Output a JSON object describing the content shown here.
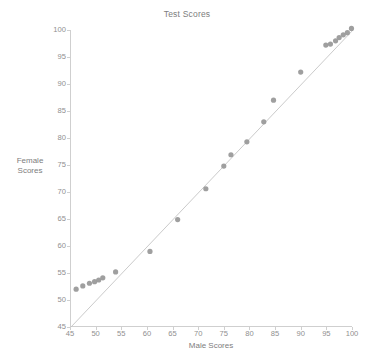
{
  "chart_data": {
    "type": "scatter",
    "title": "Test Scores",
    "xlabel": "Male Scores",
    "ylabel_line1": "Female",
    "ylabel_line2": "Scores",
    "xlim": [
      45,
      100
    ],
    "ylim": [
      45,
      100
    ],
    "xticks": [
      45,
      50,
      55,
      60,
      65,
      70,
      75,
      80,
      85,
      90,
      95,
      100
    ],
    "yticks": [
      45,
      50,
      55,
      60,
      65,
      70,
      75,
      80,
      85,
      90,
      95,
      100
    ],
    "grid": false,
    "legend": "none",
    "marker_color": "#9a9a9a",
    "line_color": "#c4c4c4",
    "reference_line": {
      "description": "y = x identity line",
      "from": [
        45,
        45
      ],
      "to": [
        100,
        100
      ]
    },
    "points": [
      {
        "x": 46.0,
        "y": 52.0
      },
      {
        "x": 47.3,
        "y": 52.6
      },
      {
        "x": 48.6,
        "y": 53.1
      },
      {
        "x": 49.6,
        "y": 53.4
      },
      {
        "x": 50.4,
        "y": 53.7
      },
      {
        "x": 51.2,
        "y": 54.1
      },
      {
        "x": 53.7,
        "y": 55.2
      },
      {
        "x": 60.4,
        "y": 59.0
      },
      {
        "x": 65.8,
        "y": 64.9
      },
      {
        "x": 71.3,
        "y": 70.6
      },
      {
        "x": 74.8,
        "y": 74.8
      },
      {
        "x": 76.2,
        "y": 76.9
      },
      {
        "x": 79.3,
        "y": 79.3
      },
      {
        "x": 82.6,
        "y": 83.0
      },
      {
        "x": 84.5,
        "y": 87.0
      },
      {
        "x": 89.8,
        "y": 92.2
      },
      {
        "x": 94.7,
        "y": 97.2
      },
      {
        "x": 95.6,
        "y": 97.4
      },
      {
        "x": 96.6,
        "y": 98.0
      },
      {
        "x": 97.3,
        "y": 98.6
      },
      {
        "x": 98.1,
        "y": 99.1
      },
      {
        "x": 98.9,
        "y": 99.5
      },
      {
        "x": 99.7,
        "y": 100.3
      }
    ]
  }
}
